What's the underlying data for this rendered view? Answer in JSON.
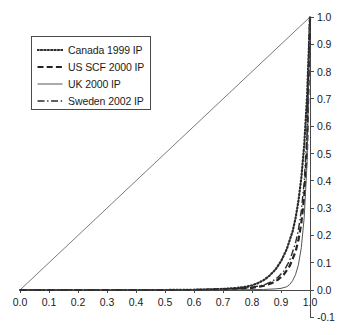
{
  "chart_data": {
    "type": "line",
    "title": "",
    "subtitle": "",
    "xlabel": "",
    "ylabel": "",
    "xlim": [
      0.0,
      1.0
    ],
    "ylim": [
      -0.1,
      1.0
    ],
    "grid": false,
    "legend_position": "top-left",
    "y_axis_side": "right",
    "xticks": [
      "0.0",
      "0.1",
      "0.2",
      "0.3",
      "0.4",
      "0.5",
      "0.6",
      "0.7",
      "0.8",
      "0.9",
      "1.0"
    ],
    "xtick_values": [
      0.0,
      0.1,
      0.2,
      0.3,
      0.4,
      0.5,
      0.6,
      0.7,
      0.8,
      0.9,
      1.0
    ],
    "yticks": [
      "1.0",
      "0.9",
      "0.8",
      "0.7",
      "0.6",
      "0.5",
      "0.4",
      "0.3",
      "0.2",
      "0.1",
      "0.0",
      "-0.1"
    ],
    "ytick_values": [
      1.0,
      0.9,
      0.8,
      0.7,
      0.6,
      0.5,
      0.4,
      0.3,
      0.2,
      0.1,
      0.0,
      -0.1
    ],
    "annotations": [
      {
        "name": "equality-line",
        "description": "45 degree diagonal reference line from (0,0) to (1,1)"
      }
    ],
    "series": [
      {
        "name": "Canada 1999 IP",
        "style": "dotted",
        "color": "#2b2b2b",
        "width": 2.2,
        "x": [
          0.0,
          0.1,
          0.2,
          0.3,
          0.4,
          0.5,
          0.6,
          0.65,
          0.7,
          0.75,
          0.78,
          0.8,
          0.82,
          0.84,
          0.86,
          0.88,
          0.9,
          0.92,
          0.94,
          0.95,
          0.96,
          0.97,
          0.98,
          0.99,
          1.0
        ],
        "y": [
          0.0,
          0.0,
          0.0,
          0.0,
          0.0,
          0.0,
          0.001,
          0.002,
          0.004,
          0.008,
          0.012,
          0.017,
          0.025,
          0.036,
          0.052,
          0.074,
          0.105,
          0.15,
          0.215,
          0.262,
          0.325,
          0.41,
          0.53,
          0.71,
          1.0
        ]
      },
      {
        "name": "US SCF 2000 IP",
        "style": "dashed",
        "color": "#232323",
        "width": 2.2,
        "x": [
          0.0,
          0.1,
          0.2,
          0.3,
          0.4,
          0.5,
          0.6,
          0.7,
          0.75,
          0.8,
          0.83,
          0.85,
          0.87,
          0.89,
          0.91,
          0.93,
          0.95,
          0.96,
          0.97,
          0.98,
          0.99,
          1.0
        ],
        "y": [
          0.0,
          0.0,
          0.0,
          0.0,
          0.0,
          0.0,
          0.0,
          0.002,
          0.004,
          0.008,
          0.013,
          0.018,
          0.026,
          0.038,
          0.057,
          0.088,
          0.14,
          0.182,
          0.245,
          0.34,
          0.52,
          1.0
        ]
      },
      {
        "name": "UK 2000 IP",
        "style": "solid",
        "color": "#555555",
        "width": 1.0,
        "x": [
          0.0,
          0.1,
          0.2,
          0.3,
          0.4,
          0.5,
          0.6,
          0.7,
          0.78,
          0.84,
          0.88,
          0.9,
          0.92,
          0.93,
          0.94,
          0.95,
          0.96,
          0.97,
          0.98,
          0.99,
          1.0
        ],
        "y": [
          0.0,
          0.0,
          0.0,
          0.0,
          0.0,
          0.0,
          0.0,
          0.0,
          0.001,
          0.002,
          0.004,
          0.006,
          0.012,
          0.02,
          0.034,
          0.056,
          0.092,
          0.155,
          0.265,
          0.47,
          1.0
        ]
      },
      {
        "name": "Sweden 2002 IP",
        "style": "dashdot",
        "color": "#2b2b2b",
        "width": 1.4,
        "x": [
          0.0,
          0.1,
          0.2,
          0.3,
          0.4,
          0.5,
          0.6,
          0.7,
          0.75,
          0.8,
          0.83,
          0.85,
          0.87,
          0.89,
          0.91,
          0.93,
          0.95,
          0.96,
          0.97,
          0.98,
          0.99,
          1.0
        ],
        "y": [
          0.0,
          0.0,
          0.0,
          0.0,
          0.0,
          0.0,
          0.001,
          0.003,
          0.005,
          0.01,
          0.016,
          0.022,
          0.032,
          0.047,
          0.07,
          0.108,
          0.172,
          0.22,
          0.29,
          0.395,
          0.58,
          1.0
        ]
      }
    ]
  },
  "legend": {
    "entries": [
      {
        "label": "Canada 1999 IP",
        "style": "dotted"
      },
      {
        "label": "US SCF 2000 IP",
        "style": "dashed"
      },
      {
        "label": "UK 2000 IP",
        "style": "solid"
      },
      {
        "label": "Sweden 2002 IP",
        "style": "dashdot"
      }
    ]
  },
  "axes": {
    "x_tick_labels": [
      "0.0",
      "0.1",
      "0.2",
      "0.3",
      "0.4",
      "0.5",
      "0.6",
      "0.7",
      "0.8",
      "0.9",
      "1.0"
    ],
    "y_tick_labels": [
      "1.0",
      "0.9",
      "0.8",
      "0.7",
      "0.6",
      "0.5",
      "0.4",
      "0.3",
      "0.2",
      "0.1",
      "0.0",
      "-0.1"
    ]
  }
}
